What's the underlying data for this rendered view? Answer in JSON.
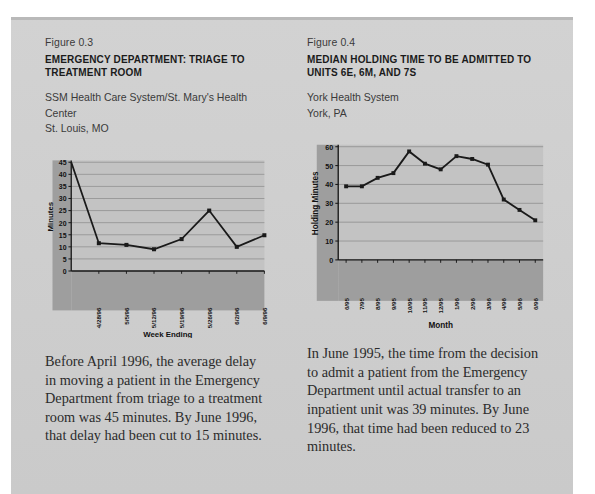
{
  "page": {
    "background_color": "#cdcdcd",
    "text_color": "#2b2b2b"
  },
  "figures": [
    {
      "number": "Figure 0.3",
      "title": "EMERGENCY DEPARTMENT: TRIAGE TO TREATMENT ROOM",
      "source_line1": "SSM Health Care System/St. Mary's Health Center",
      "source_line2": "St. Louis, MO",
      "caption": "Before April 1996, the average delay in moving a patient in the Emergency Department from triage to a treatment room was 45 minutes. By June 1996, that delay had been cut to 15 minutes."
    },
    {
      "number": "Figure 0.4",
      "title_line1": "MEDIAN HOLDING TIME TO BE ADMITTED TO",
      "title_line2": "UNITS 6E, 6M, AND 7S",
      "source_line1": "York Health System",
      "source_line2": "York, PA",
      "caption": "In June 1995, the time from the decision to admit a patient from the Emergency Department until actual transfer to an inpatient unit was 39 minutes. By June 1996, that time had been reduced to 23 minutes."
    }
  ],
  "chart_data": [
    {
      "type": "line",
      "title": "EMERGENCY DEPARTMENT: TRIAGE TO TREATMENT ROOM",
      "xlabel": "Week Ending",
      "ylabel": "Minutes",
      "categories": [
        "",
        "4/28/96",
        "5/5/96",
        "5/12/96",
        "5/19/96",
        "5/26/96",
        "6/2/96",
        "6/9/96"
      ],
      "tick_labels": [
        "4/28/96",
        "5/5/96",
        "5/12/96",
        "5/19/96",
        "5/26/96",
        "6/2/96",
        "6/9/96"
      ],
      "values": [
        45,
        11.5,
        10.8,
        9,
        13.2,
        25,
        10,
        14.8
      ],
      "ylim": [
        0,
        45
      ],
      "yticks": [
        0,
        5,
        10,
        15,
        20,
        25,
        30,
        35,
        40,
        45
      ],
      "grid": true,
      "legend": "none",
      "marker": "square",
      "line_color": "#1a1a1a",
      "plot_bg": "#c3c3c3",
      "axis_band_color": "#9e9e9e"
    },
    {
      "type": "line",
      "title": "MEDIAN HOLDING TIME TO BE ADMITTED TO UNITS 6E, 6M, AND 7S",
      "xlabel": "Month",
      "ylabel": "Holding Minutes",
      "categories": [
        "6/95",
        "7/95",
        "8/95",
        "9/95",
        "10/95",
        "11/95",
        "12/95",
        "1/96",
        "2/96",
        "3/96",
        "4/96",
        "5/96",
        "6/96"
      ],
      "tick_labels": [
        "6/95",
        "7/95",
        "8/95",
        "9/95",
        "10/95",
        "11/95",
        "12/95",
        "1/96",
        "2/96",
        "3/96",
        "4/96",
        "5/96",
        "6/96"
      ],
      "values": [
        39,
        39,
        43.5,
        46,
        57.5,
        51,
        48,
        55,
        53.5,
        50.5,
        32,
        26.5,
        21
      ],
      "ylim": [
        0,
        60
      ],
      "yticks": [
        0,
        10,
        20,
        30,
        40,
        50,
        60
      ],
      "grid": true,
      "legend": "none",
      "marker": "square",
      "line_color": "#1a1a1a",
      "plot_bg": "#c3c3c3",
      "axis_band_color": "#9e9e9e"
    }
  ]
}
